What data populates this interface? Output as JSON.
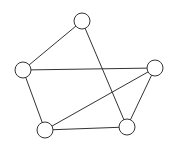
{
  "diagram": {
    "type": "graph",
    "nodes": [
      {
        "id": "top",
        "x": 82,
        "y": 21
      },
      {
        "id": "left",
        "x": 23,
        "y": 70
      },
      {
        "id": "right",
        "x": 155,
        "y": 68
      },
      {
        "id": "bottom-left",
        "x": 45,
        "y": 130
      },
      {
        "id": "bottom-right",
        "x": 127,
        "y": 127
      }
    ],
    "edges": [
      [
        "top",
        "left"
      ],
      [
        "top",
        "bottom-right"
      ],
      [
        "left",
        "right"
      ],
      [
        "left",
        "bottom-left"
      ],
      [
        "right",
        "bottom-left"
      ],
      [
        "right",
        "bottom-right"
      ],
      [
        "bottom-left",
        "bottom-right"
      ]
    ],
    "node_radius": 8,
    "stroke_color": "#333333",
    "fill_color": "#ffffff"
  }
}
